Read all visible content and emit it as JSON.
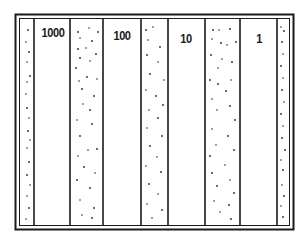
{
  "diagram": {
    "type": "zone-strip-diagram",
    "stroke_color": "#1a1a1a",
    "background": "#ffffff",
    "stipple_color": "#2a2a2a",
    "columns": [
      {
        "kind": "stippled",
        "label": ""
      },
      {
        "kind": "clear",
        "label": "1000"
      },
      {
        "kind": "stippled",
        "label": ""
      },
      {
        "kind": "clear",
        "label": "100"
      },
      {
        "kind": "stippled",
        "label": ""
      },
      {
        "kind": "clear",
        "label": "10"
      },
      {
        "kind": "stippled",
        "label": ""
      },
      {
        "kind": "clear",
        "label": "1"
      },
      {
        "kind": "stippled",
        "label": ""
      }
    ]
  },
  "labels": {
    "col_1000": "1000",
    "col_100": "100",
    "col_10": "10",
    "col_1": "1"
  }
}
